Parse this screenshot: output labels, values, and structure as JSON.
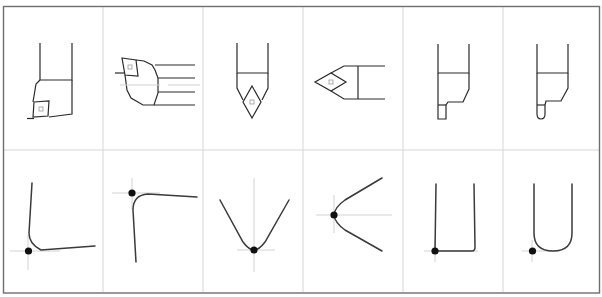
{
  "figure": {
    "layout": {
      "rows": 2,
      "columns": 6
    },
    "colors": {
      "frame": "#6e6e6e",
      "grid": "#d6d6d6",
      "line": "#2a2a2a",
      "reference_point": "#111111"
    },
    "top_row": [
      {
        "id": "tool-1",
        "type": "turning-tool-square-insert-side"
      },
      {
        "id": "tool-2",
        "type": "boring-bar-square-insert"
      },
      {
        "id": "tool-3",
        "type": "turning-tool-diamond-insert-vertical"
      },
      {
        "id": "tool-4",
        "type": "turning-tool-diamond-insert-horizontal"
      },
      {
        "id": "tool-5",
        "type": "grooving-tool-square-tip"
      },
      {
        "id": "tool-6",
        "type": "grooving-tool-round-tip"
      }
    ],
    "bottom_row": [
      {
        "id": "profile-1",
        "type": "nose-radius-corner-bottom-left",
        "reference_point": "bottom-left"
      },
      {
        "id": "profile-2",
        "type": "nose-radius-corner-top-left",
        "reference_point": "top-left"
      },
      {
        "id": "profile-3",
        "type": "v-nose-downward",
        "reference_point": "bottom-center"
      },
      {
        "id": "profile-4",
        "type": "v-nose-leftward",
        "reference_point": "left-center"
      },
      {
        "id": "profile-5",
        "type": "square-groove-profile",
        "reference_point": "bottom-left"
      },
      {
        "id": "profile-6",
        "type": "round-groove-profile",
        "reference_point": "bottom-left"
      }
    ]
  }
}
